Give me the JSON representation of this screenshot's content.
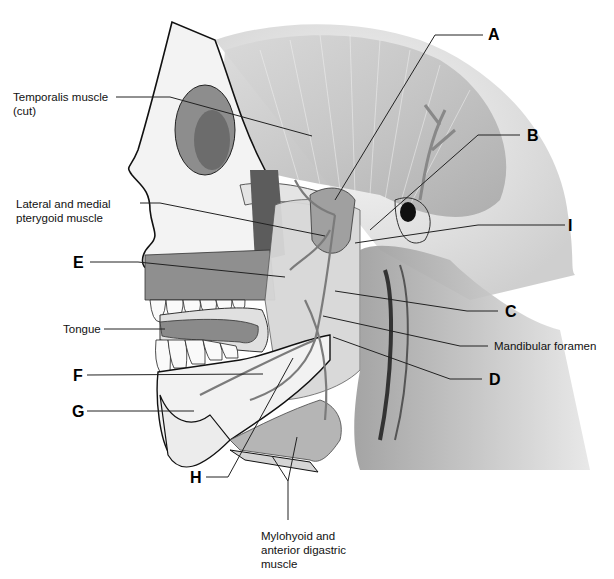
{
  "diagram": {
    "text_labels": [
      {
        "id": "temporalis",
        "text": "Temporalis muscle (cut)",
        "lines": [
          "Temporalis muscle",
          "(cut)"
        ]
      },
      {
        "id": "pterygoid",
        "text": "Lateral and medial pterygoid muscle",
        "lines": [
          "Lateral and medial",
          "pterygoid muscle"
        ]
      },
      {
        "id": "tongue",
        "text": "Tongue",
        "lines": [
          "Tongue"
        ]
      },
      {
        "id": "mandibular_foramen",
        "text": "Mandibular foramen",
        "lines": [
          "Mandibular foramen"
        ]
      },
      {
        "id": "mylohyoid",
        "text": "Mylohyoid and anterior digastric muscle",
        "lines": [
          "Mylohyoid and",
          "anterior digastric",
          "muscle"
        ]
      }
    ],
    "letter_labels": [
      "A",
      "B",
      "C",
      "D",
      "E",
      "F",
      "G",
      "H",
      "I"
    ],
    "colors": {
      "background": "#ffffff",
      "outline": "#111111",
      "muscle": "#b8b8b8",
      "bone": "#eeeeee",
      "shadow": "#7a7a7a",
      "leader_line": "#222222"
    }
  }
}
